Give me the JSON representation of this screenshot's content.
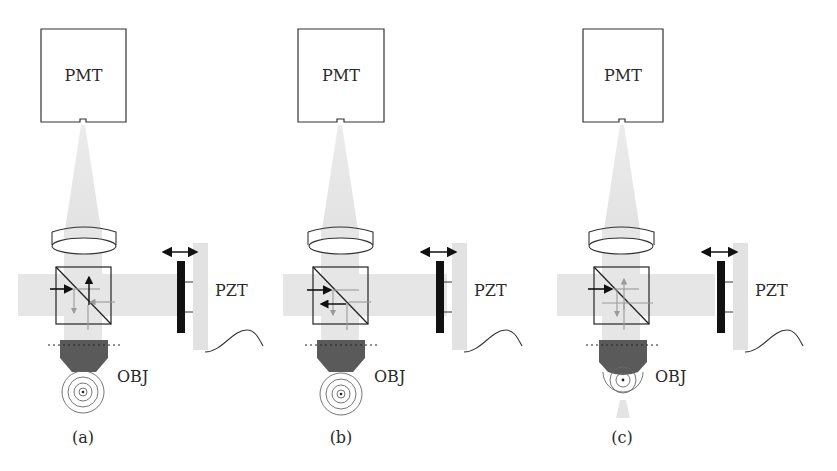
{
  "figure": {
    "panels": [
      {
        "id": "a",
        "caption": "(a)",
        "offset_x": 0,
        "detector_label": "PMT",
        "objective_label": "OBJ",
        "actuator_label": "PZT",
        "cube_state": "reference-and-sample-arms-separated",
        "focus_rings": 4,
        "beam_below_objective": false
      },
      {
        "id": "b",
        "caption": "(b)",
        "offset_x": 271,
        "detector_label": "PMT",
        "objective_label": "OBJ",
        "actuator_label": "PZT",
        "cube_state": "return-beams-reflected-back-to-source",
        "focus_rings": 4,
        "beam_below_objective": false
      },
      {
        "id": "c",
        "caption": "(c)",
        "offset_x": 542,
        "detector_label": "PMT",
        "objective_label": "OBJ",
        "actuator_label": "PZT",
        "cube_state": "beams-crossing-at-splitter",
        "focus_rings": 3,
        "beam_below_objective": true
      }
    ],
    "colors": {
      "beam": "#e6e6e6",
      "outline": "#333333",
      "objective": "#5a5a5a",
      "mirror": "#111111",
      "secondary_arrow": "#9a9a9a"
    }
  }
}
